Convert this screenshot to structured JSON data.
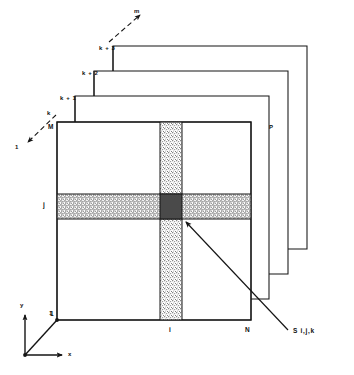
{
  "figure": {
    "colors": {
      "line": "#151515",
      "band_light": "#cfcfcf",
      "band_dot": "#8f8f8f",
      "cell_dark": "#4a4a4a",
      "background": "#ffffff"
    }
  },
  "layers": {
    "labels": [
      {
        "id": "layer-k",
        "text": "k"
      },
      {
        "id": "layer-k1",
        "text": "k + 1"
      },
      {
        "id": "layer-k2",
        "text": "k + 2"
      },
      {
        "id": "layer-k3",
        "text": "k + 3"
      }
    ],
    "depth_axis_end": "m",
    "depth_axis_start": "1",
    "depth_side_label": "P"
  },
  "grid": {
    "row_label": "j",
    "column_label": "i",
    "x_max_label": "N",
    "y_max_label": "M",
    "x_min_label": "1",
    "y_min_label": "1"
  },
  "axes": {
    "x_label": "x",
    "y_label": "y",
    "origin_label": "1"
  },
  "callout": {
    "label": "S i,j,k"
  }
}
